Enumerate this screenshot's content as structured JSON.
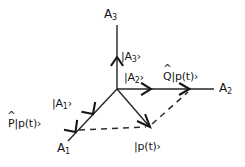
{
  "figure": {
    "kind": "vector-diagram",
    "background_color": "#ffffff",
    "line_color": "#262626",
    "dash_color": "#2b2b2b",
    "text_color": "#161616",
    "width": 245,
    "height": 167
  },
  "axes": [
    {
      "id": "a3",
      "label_main": "A",
      "label_sub": "3",
      "direction": "up"
    },
    {
      "id": "a2",
      "label_main": "A",
      "label_sub": "2",
      "direction": "right"
    },
    {
      "id": "a1",
      "label_main": "A",
      "label_sub": "1",
      "direction": "down-left"
    }
  ],
  "vectors": [
    {
      "id": "ket-a3",
      "label_prefix": "|A",
      "label_sub": "3",
      "label_suffix": "›",
      "along_axis": "a3"
    },
    {
      "id": "ket-a2",
      "label_prefix": "|A",
      "label_sub": "2",
      "label_suffix": "›",
      "along_axis": "a2"
    },
    {
      "id": "ket-a1",
      "label_prefix": "|A",
      "label_sub": "1",
      "label_suffix": "›",
      "along_axis": "a1"
    },
    {
      "id": "q-projection",
      "hat_letter": "Q",
      "label_rest": "|p(t)›",
      "along_axis": "a2"
    },
    {
      "id": "p-projection",
      "hat_letter": "P",
      "label_rest": "|p(t)›",
      "along_axis": "a1"
    },
    {
      "id": "state-vector",
      "label": "|p(t)›",
      "along_axis": "none"
    }
  ],
  "labels": {
    "axis_a3": {
      "main": "A",
      "sub": "3"
    },
    "axis_a2": {
      "main": "A",
      "sub": "2"
    },
    "axis_a1": {
      "main": "A",
      "sub": "1"
    },
    "ket_a3": {
      "prefix": "|A",
      "sub": "3",
      "suffix": "›"
    },
    "ket_a2": {
      "prefix": "|A",
      "sub": "2",
      "suffix": "›"
    },
    "ket_a1": {
      "prefix": "|A",
      "sub": "1",
      "suffix": "›"
    },
    "q_ket": {
      "hat": "Q",
      "rest": "|p(t)›"
    },
    "p_ket": {
      "hat": "P",
      "rest": "|p(t)›"
    },
    "state_ket": {
      "text": "|p(t)›"
    }
  },
  "geometry": {
    "origin": {
      "x": 117,
      "y": 89
    },
    "a3_axis_top": {
      "x": 117,
      "y": 25
    },
    "a2_axis_right": {
      "x": 214,
      "y": 89
    },
    "a1_axis_end": {
      "x": 68,
      "y": 140
    },
    "ket_a3_head": {
      "x": 117,
      "y": 58
    },
    "ket_a2_head": {
      "x": 150,
      "y": 89
    },
    "ket_a1_head": {
      "x": 94,
      "y": 113
    },
    "q_head": {
      "x": 189,
      "y": 89
    },
    "p_head": {
      "x": 76,
      "y": 132
    },
    "state_head": {
      "x": 148,
      "y": 125
    }
  }
}
